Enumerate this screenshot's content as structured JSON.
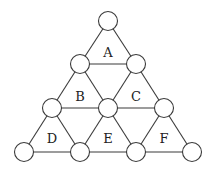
{
  "diagram": {
    "type": "triangular-grid",
    "node_radius": 9.5,
    "nodes": [
      {
        "id": "n0",
        "x": 108,
        "y": 21
      },
      {
        "id": "n1",
        "x": 80,
        "y": 64
      },
      {
        "id": "n2",
        "x": 136,
        "y": 64
      },
      {
        "id": "n3",
        "x": 52,
        "y": 108
      },
      {
        "id": "n4",
        "x": 108,
        "y": 108
      },
      {
        "id": "n5",
        "x": 164,
        "y": 108
      },
      {
        "id": "n6",
        "x": 24,
        "y": 152
      },
      {
        "id": "n7",
        "x": 80,
        "y": 152
      },
      {
        "id": "n8",
        "x": 136,
        "y": 152
      },
      {
        "id": "n9",
        "x": 192,
        "y": 152
      }
    ],
    "edges": [
      [
        "n0",
        "n1"
      ],
      [
        "n0",
        "n2"
      ],
      [
        "n1",
        "n2"
      ],
      [
        "n1",
        "n3"
      ],
      [
        "n1",
        "n4"
      ],
      [
        "n2",
        "n4"
      ],
      [
        "n2",
        "n5"
      ],
      [
        "n3",
        "n4"
      ],
      [
        "n4",
        "n5"
      ],
      [
        "n3",
        "n6"
      ],
      [
        "n3",
        "n7"
      ],
      [
        "n4",
        "n7"
      ],
      [
        "n4",
        "n8"
      ],
      [
        "n5",
        "n8"
      ],
      [
        "n5",
        "n9"
      ],
      [
        "n6",
        "n7"
      ],
      [
        "n7",
        "n8"
      ],
      [
        "n8",
        "n9"
      ]
    ],
    "regions": [
      {
        "label": "A",
        "x": 108,
        "y": 52
      },
      {
        "label": "B",
        "x": 80,
        "y": 96
      },
      {
        "label": "C",
        "x": 136,
        "y": 96
      },
      {
        "label": "D",
        "x": 52,
        "y": 138
      },
      {
        "label": "E",
        "x": 108,
        "y": 138
      },
      {
        "label": "F",
        "x": 164,
        "y": 138
      }
    ]
  }
}
